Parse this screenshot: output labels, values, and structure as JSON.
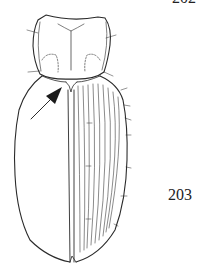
{
  "figure": {
    "labels": {
      "fig_top": "202",
      "fig_main": "203"
    },
    "parts": [
      "pronotum",
      "elytra",
      "elytral-striae",
      "suture",
      "setae"
    ],
    "annotation": "arrow pointing to elytral base near scutellum",
    "colors": {
      "line": "#2a2a2a",
      "background": "#ffffff"
    }
  }
}
